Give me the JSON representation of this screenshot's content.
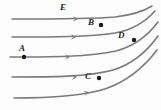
{
  "figure": {
    "kind": "streamline-field-diagram",
    "width": 161,
    "height": 110,
    "background_color": "#fdfdfd",
    "stroke_color": "#7a7a7f",
    "marker_color": "#1a1a1a",
    "label_color": "#222222"
  },
  "labels": [
    {
      "id": "E",
      "text": "E",
      "x": 60,
      "y": 3
    },
    {
      "id": "B",
      "text": "B",
      "x": 88,
      "y": 18
    },
    {
      "id": "A",
      "text": "A",
      "x": 19,
      "y": 44
    },
    {
      "id": "D",
      "text": "D",
      "x": 118,
      "y": 31
    },
    {
      "id": "C",
      "text": "C",
      "x": 85,
      "y": 72
    }
  ],
  "points": [
    {
      "id": "B",
      "cx": 101,
      "cy": 25
    },
    {
      "id": "A",
      "cx": 24,
      "cy": 57
    },
    {
      "id": "D",
      "cx": 134,
      "cy": 40
    },
    {
      "id": "C",
      "cx": 99,
      "cy": 78
    }
  ],
  "streamlines": [
    {
      "id": "streamline-1",
      "path": "M 12 19 C 50 19, 90 19, 115 17 C 132 15, 144 11, 152 6",
      "arrow": {
        "x": 78,
        "y": 19,
        "angle": 0
      }
    },
    {
      "id": "streamline-2",
      "path": "M 12 37 C 50 37, 90 37, 115 33 C 133 30, 146 21, 155 11",
      "arrow": {
        "x": 76,
        "y": 37,
        "angle": 0
      }
    },
    {
      "id": "streamline-3",
      "path": "M 10 57 C 48 57, 90 57, 116 51 C 135 46, 149 34, 158 22",
      "arrow": {
        "x": 70,
        "y": 57,
        "angle": 0
      }
    },
    {
      "id": "streamline-4",
      "path": "M 12 77 C 50 77, 88 77, 113 70 C 133 64, 148 50, 158 36",
      "arrow": {
        "x": 77,
        "y": 77,
        "angle": -2
      }
    },
    {
      "id": "streamline-5",
      "path": "M 14 98 C 48 98, 82 96, 105 89 C 128 81, 145 66, 157 50",
      "arrow": {
        "x": 89,
        "y": 92,
        "angle": -16
      }
    }
  ]
}
